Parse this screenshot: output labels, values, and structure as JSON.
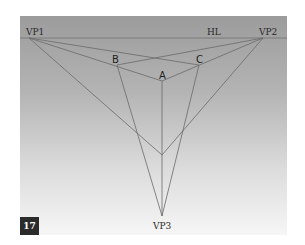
{
  "figure": {
    "number": "17",
    "labels": {
      "vp1": "VP1",
      "vp2": "VP2",
      "vp3": "VP3",
      "horizon": "HL",
      "a": "A",
      "b": "B",
      "c": "C"
    },
    "colors": {
      "background_top": "#9c9c9c",
      "background_bottom": "#f6f6f6",
      "line": "#6a6a6a",
      "badge": "#2b2b2b"
    }
  }
}
